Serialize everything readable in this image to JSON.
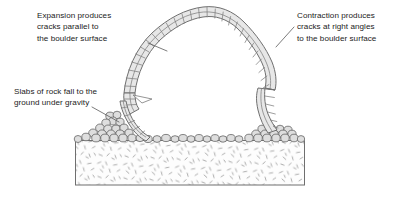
{
  "figure": {
    "background_color": "#ffffff"
  },
  "annotations": [
    {
      "id": "expansion",
      "name": "annotation-expansion",
      "lines": [
        "Expansion produces",
        "cracks parallel to",
        "the boulder surface"
      ],
      "leader_from": [
        148,
        43
      ],
      "leader_to": [
        167,
        50
      ]
    },
    {
      "id": "contraction",
      "name": "annotation-contraction",
      "lines": [
        "Contraction produces",
        "cracks at right angles",
        "to the boulder surface"
      ],
      "leader_from": [
        294,
        27
      ],
      "leader_to": [
        277,
        47
      ]
    },
    {
      "id": "slabs",
      "name": "annotation-slabs",
      "lines": [
        "Slabs of rock fall to the",
        "ground under gravity"
      ],
      "leader_from": [
        92,
        107
      ],
      "leader_to": [
        119,
        122
      ]
    }
  ],
  "colors": {
    "outline": "#6f6f6f",
    "block_fill": "#e7e7e7",
    "block_stroke": "#7d7d7d",
    "pebble_fill": "#dcdcdc",
    "pebble_stroke": "#6a6a6a",
    "ground_fill": "#fdfdfd",
    "ground_stroke": "#6f6f6f",
    "stipple": "#9a9a9a",
    "leader": "#5a5a5a",
    "text": "#1b1b1b"
  },
  "geology": {
    "boulder_shell_label": "weathered rock shell with parallel and right-angle cracks",
    "ground_layer_label": "regolith / sediment bed",
    "scree_label": "fallen rock slabs and pebbles"
  }
}
